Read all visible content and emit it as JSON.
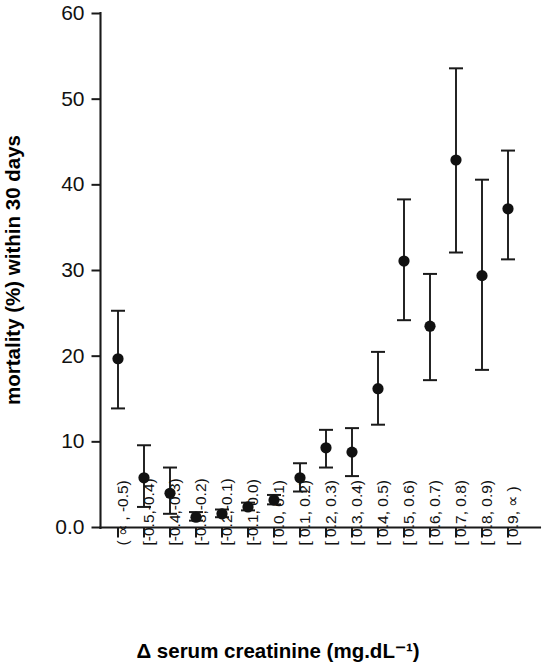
{
  "chart_data": {
    "type": "scatter",
    "title": "",
    "xlabel": "Δ serum creatinine (mg.dL⁻¹)",
    "ylabel": "mortality (%) within 30 days",
    "ylim": [
      0,
      60
    ],
    "yticks": [
      0,
      10,
      20,
      30,
      40,
      50,
      60
    ],
    "ytick_labels": [
      "0.0",
      "10",
      "20",
      "30",
      "40",
      "50",
      "60"
    ],
    "grid": false,
    "legend": null,
    "error_bars": "vertical, capped (95% confidence interval)",
    "categories": [
      "( ∝ , -0.5)",
      "[-0.5,-0.4)",
      "[-0.4,-0.3)",
      "[-0.3,-0.2)",
      "[-0.2,-0.1)",
      "[-0.1, 0.0)",
      "[ 0.0, 0.1)",
      "[ 0.1, 0.2)",
      "[ 0.2, 0.3)",
      "[ 0.3, 0.4)",
      "[ 0.4, 0.5)",
      "[ 0.5, 0.6)",
      "[ 0.6, 0.7)",
      "[ 0.7, 0.8)",
      "[ 0.8, 0.9)",
      "[ 0.9, ∝ )"
    ],
    "values": [
      19.7,
      5.8,
      4.0,
      1.2,
      1.6,
      2.4,
      3.2,
      5.8,
      9.3,
      8.8,
      16.2,
      31.1,
      23.5,
      42.9,
      29.4,
      37.2
    ],
    "errors_low": [
      13.9,
      2.4,
      1.6,
      0.8,
      1.2,
      2.0,
      2.7,
      4.2,
      7.0,
      6.0,
      12.0,
      24.2,
      17.2,
      32.1,
      18.4,
      31.3
    ],
    "errors_high": [
      25.3,
      9.6,
      7.0,
      1.8,
      2.1,
      2.9,
      3.8,
      7.5,
      11.4,
      11.6,
      20.5,
      38.3,
      29.6,
      53.6,
      40.6,
      44.0
    ],
    "marker": "filled-circle",
    "marker_color": "#111111",
    "line_color": "#1a1a1a"
  }
}
